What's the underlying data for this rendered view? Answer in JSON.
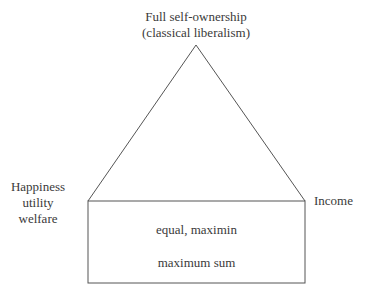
{
  "diagram": {
    "top_label": {
      "line1": "Full self-ownership",
      "line2": "(classical liberalism)"
    },
    "left_label": {
      "line1": "Happiness",
      "line2": "utility",
      "line3": "welfare"
    },
    "right_label": "Income",
    "box": {
      "line1": "equal, maximin",
      "line2": "maximum sum"
    },
    "stroke_color": "#555555",
    "text_color": "#3a3a3a"
  }
}
